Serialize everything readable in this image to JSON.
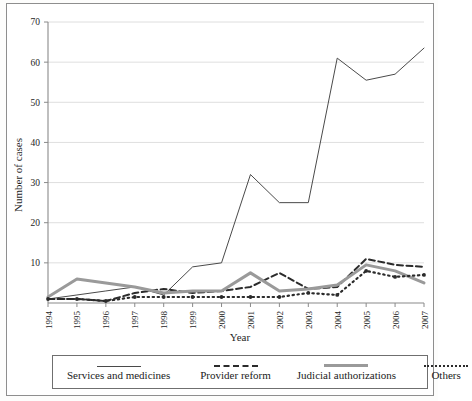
{
  "chart_data": {
    "type": "line",
    "title": "",
    "xlabel": "Year",
    "ylabel": "Number of cases",
    "categories": [
      "1994",
      "1995",
      "1996",
      "1997",
      "1998",
      "1999",
      "2000",
      "2001",
      "2002",
      "2003",
      "2004",
      "2005",
      "2006",
      "2007"
    ],
    "x": [
      1994,
      1995,
      1996,
      1997,
      1998,
      1999,
      2000,
      2001,
      2002,
      2003,
      2004,
      2005,
      2006,
      2007
    ],
    "ylim": [
      0,
      70
    ],
    "yticks": [
      0,
      10,
      20,
      30,
      40,
      50,
      60,
      70
    ],
    "ytick_labels": [
      "0",
      "10",
      "20",
      "30",
      "40",
      "50",
      "60",
      "70"
    ],
    "grid": "horizontal",
    "legend_position": "bottom",
    "series": [
      {
        "name": "Services and medicines",
        "style": "thin-solid",
        "color": "#4a4a4a",
        "values": [
          1,
          2,
          3,
          4,
          2,
          9,
          10,
          32,
          25,
          25,
          61,
          55.5,
          57,
          63.5
        ]
      },
      {
        "name": "Provider reform",
        "style": "dashed",
        "color": "#2b2b2b",
        "values": [
          1,
          1,
          0.5,
          2.5,
          3.5,
          2.5,
          3,
          4,
          7.5,
          3.5,
          4,
          11,
          9.5,
          9
        ]
      },
      {
        "name": "Judicial authorizations",
        "style": "thick-solid",
        "color": "#9a9a9a",
        "values": [
          1.5,
          6,
          5,
          4,
          2.5,
          3,
          3,
          7.5,
          3,
          3.5,
          4.5,
          9.5,
          8,
          5
        ]
      },
      {
        "name": "Others",
        "style": "dotted",
        "color": "#2b2b2b",
        "values": [
          1,
          1,
          0.5,
          1.5,
          1.5,
          1.5,
          1.5,
          1.5,
          1.5,
          2.5,
          2,
          8,
          6.5,
          7
        ]
      }
    ]
  },
  "legend": {
    "items": [
      {
        "label": "Services and medicines"
      },
      {
        "label": "Provider reform"
      },
      {
        "label": "Judicial authorizations"
      },
      {
        "label": "Others"
      }
    ]
  },
  "axes": {
    "y_title": "Number of cases",
    "x_title": "Year"
  }
}
